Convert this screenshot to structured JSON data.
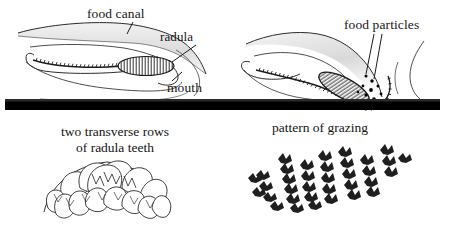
{
  "figure": {
    "background_color": "#ffffff",
    "ink_color": "#161616",
    "substrate_color": "#000000"
  },
  "panels": {
    "top_left": {
      "name": "radula-retracted",
      "labels": [
        {
          "id": "food-canal",
          "text": "food canal"
        },
        {
          "id": "radula",
          "text": "radula"
        },
        {
          "id": "mouth",
          "text": "mouth"
        }
      ]
    },
    "top_right": {
      "name": "radula-grazing",
      "labels": [
        {
          "id": "food-particles",
          "text": "food particles"
        }
      ]
    },
    "bottom_left": {
      "name": "radula-teeth-detail",
      "caption_line_1": "two transverse rows",
      "caption_line_2": "of radula teeth"
    },
    "bottom_right": {
      "name": "grazing-pattern",
      "caption_line_1": "pattern of grazing"
    }
  },
  "substrate": {
    "name": "substrate-bar",
    "color": "#000000"
  }
}
